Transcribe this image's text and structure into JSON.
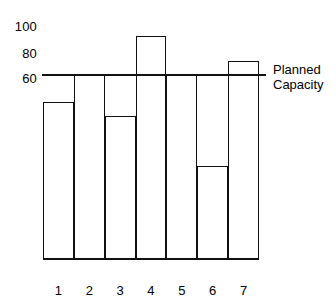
{
  "chart_data": {
    "type": "bar",
    "title": "",
    "subtitle": "",
    "xlabel": "",
    "ylabel": "",
    "categories": [
      "1",
      "2",
      "3",
      "4",
      "5",
      "6",
      "7"
    ],
    "values": [
      68,
      80,
      62,
      97,
      80,
      40,
      86
    ],
    "series": [
      {
        "name": "Capacity utilisation",
        "values": [
          68,
          80,
          62,
          97,
          80,
          40,
          86
        ]
      }
    ],
    "ylim": [
      0,
      104
    ],
    "ytick_labels": [
      "100",
      "80",
      "60"
    ],
    "ytick_values": [
      100,
      80,
      60
    ],
    "grid": false,
    "legend": "none",
    "annotations": [
      {
        "name": "planned-capacity",
        "value": 80,
        "label_line1": "Planned",
        "label_line2": "Capacity",
        "orientation": "horizontal"
      }
    ],
    "colors": {
      "ink": "#111111",
      "background": "#ffffff",
      "bar_fill": "transparent"
    }
  },
  "axis": {
    "y_ticks": [
      {
        "label": "100",
        "value": 100
      },
      {
        "label": "80",
        "value": 80
      },
      {
        "label": "60",
        "value": 60
      }
    ],
    "x_ticks": [
      {
        "label": "1"
      },
      {
        "label": "2"
      },
      {
        "label": "3"
      },
      {
        "label": "4"
      },
      {
        "label": "5"
      },
      {
        "label": "6"
      },
      {
        "label": "7"
      }
    ]
  },
  "reference": {
    "line1": "Planned",
    "line2": "Capacity"
  }
}
